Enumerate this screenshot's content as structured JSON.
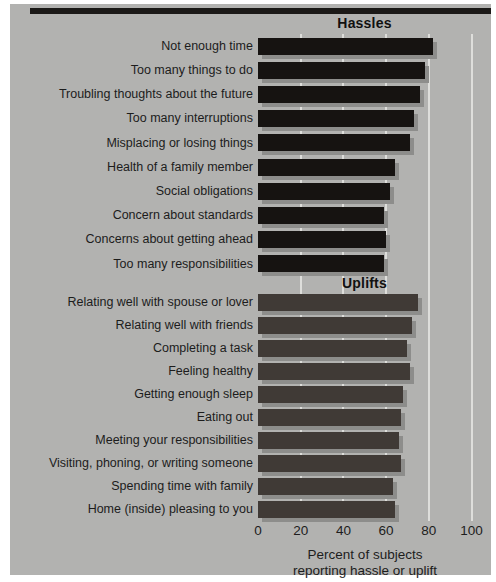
{
  "figure_type": "horizontal-bar-chart",
  "colors": {
    "page_background": "#ffffff",
    "panel_background": "#b2b2b0",
    "hassle_bar": "#161311",
    "uplift_bar": "#403a36",
    "bar_shadow": "#8d8d8b",
    "gridline": "#dededb",
    "text": "#1c1c1c",
    "top_rule": "#1b1917"
  },
  "chart_data": {
    "type": "bar",
    "orientation": "horizontal",
    "grid": true,
    "xlim": [
      0,
      100
    ],
    "x_ticks": [
      "0",
      "20",
      "40",
      "60",
      "80",
      "100"
    ],
    "xlabel": "Percent of subjects reporting hassle or uplift",
    "axis_title_lines": [
      "Percent of subjects",
      "reporting hassle or uplift"
    ],
    "series": [
      {
        "name": "Hassles",
        "color": "#161311",
        "items": [
          {
            "label": "Not enough time",
            "value": 82
          },
          {
            "label": "Too many things to do",
            "value": 78
          },
          {
            "label": "Troubling thoughts about the future",
            "value": 76
          },
          {
            "label": "Too many interruptions",
            "value": 73
          },
          {
            "label": "Misplacing or losing things",
            "value": 71
          },
          {
            "label": "Health of a family member",
            "value": 64
          },
          {
            "label": "Social obligations",
            "value": 62
          },
          {
            "label": "Concern about standards",
            "value": 59
          },
          {
            "label": "Concerns about getting ahead",
            "value": 60
          },
          {
            "label": "Too many responsibilities",
            "value": 59
          }
        ]
      },
      {
        "name": "Uplifts",
        "color": "#403a36",
        "items": [
          {
            "label": "Relating well with spouse or lover",
            "value": 75
          },
          {
            "label": "Relating well with friends",
            "value": 72
          },
          {
            "label": "Completing a task",
            "value": 70
          },
          {
            "label": "Feeling healthy",
            "value": 71
          },
          {
            "label": "Getting enough sleep",
            "value": 68
          },
          {
            "label": "Eating out",
            "value": 67
          },
          {
            "label": "Meeting your responsibilities",
            "value": 66
          },
          {
            "label": "Visiting, phoning, or writing someone",
            "value": 67
          },
          {
            "label": "Spending time with family",
            "value": 63
          },
          {
            "label": "Home (inside) pleasing to you",
            "value": 64
          }
        ]
      }
    ]
  }
}
